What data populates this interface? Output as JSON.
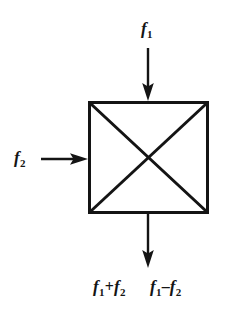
{
  "figure": {
    "type": "block-diagram",
    "background_color": "#ffffff",
    "stroke_color": "#141414",
    "text_color": "#141414"
  },
  "block": {
    "name": "mixer-block",
    "shape": "square-with-x-diagonals",
    "x": 88,
    "y": 101,
    "width": 121,
    "height": 113,
    "border_width": 3,
    "diagonal_width": 3,
    "fill": "#ffffff"
  },
  "signals": {
    "input_top": {
      "label_text": "f1",
      "variable": "f",
      "subscript": "1",
      "direction": "down",
      "arrow_from_y": 48,
      "arrow_to_y": 101,
      "arrow_x": 148
    },
    "input_left": {
      "label_text": "f2",
      "variable": "f",
      "subscript": "2",
      "direction": "right",
      "arrow_from_x": 40,
      "arrow_to_x": 88,
      "arrow_y": 159
    },
    "output_bottom": {
      "direction": "down",
      "arrow_from_y": 214,
      "arrow_to_y": 268,
      "arrow_x": 148,
      "labels": [
        {
          "id": "sum",
          "text": "f1+f2",
          "lhs_variable": "f",
          "lhs_subscript": "1",
          "operator": "+",
          "rhs_variable": "f",
          "rhs_subscript": "2"
        },
        {
          "id": "difference",
          "text": "f1-f2",
          "lhs_variable": "f",
          "lhs_subscript": "1",
          "operator": "–",
          "rhs_variable": "f",
          "rhs_subscript": "2"
        }
      ]
    }
  }
}
